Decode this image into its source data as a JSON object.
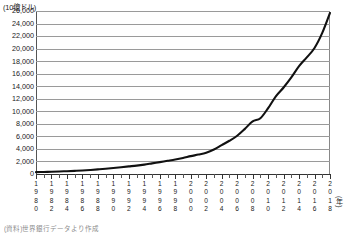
{
  "chart_data": {
    "type": "line",
    "title": "",
    "xlabel": "(年)",
    "ylabel": "(10億ドル)",
    "y_unit_label": "(10億ドル)",
    "x_unit_label": "(年)",
    "ylim": [
      0,
      26000
    ],
    "ytick_step": 2000,
    "grid": true,
    "legend": null,
    "yticks": [
      "26,000",
      "24,000",
      "22,000",
      "20,000",
      "18,000",
      "16,000",
      "14,000",
      "12,000",
      "10,000",
      "8,000",
      "6,000",
      "4,000",
      "2,000",
      "0"
    ],
    "ytick_values": [
      26000,
      24000,
      22000,
      20000,
      18000,
      16000,
      14000,
      12000,
      10000,
      8000,
      6000,
      4000,
      2000,
      0
    ],
    "xtick_labels": [
      "1980",
      "1982",
      "1984",
      "1986",
      "1988",
      "1990",
      "1992",
      "1994",
      "1996",
      "1998",
      "2000",
      "2002",
      "2004",
      "2006",
      "2008",
      "2010",
      "2012",
      "2014",
      "2016",
      "2018"
    ],
    "x": [
      1980,
      1981,
      1982,
      1983,
      1984,
      1985,
      1986,
      1987,
      1988,
      1989,
      1990,
      1991,
      1992,
      1993,
      1994,
      1995,
      1996,
      1997,
      1998,
      1999,
      2000,
      2001,
      2002,
      2003,
      2004,
      2005,
      2006,
      2007,
      2008,
      2009,
      2010,
      2011,
      2012,
      2013,
      2014,
      2015,
      2016,
      2017,
      2018
    ],
    "values": [
      300,
      330,
      360,
      400,
      450,
      500,
      560,
      640,
      730,
      830,
      950,
      1080,
      1210,
      1340,
      1500,
      1700,
      1900,
      2100,
      2300,
      2550,
      2850,
      3100,
      3400,
      3900,
      4600,
      5300,
      6100,
      7200,
      8400,
      8900,
      10500,
      12400,
      13800,
      15400,
      17200,
      18600,
      20100,
      22500,
      25700
    ],
    "series_color": "#111111",
    "gridline_color": "#9a9a9a",
    "axis_color": "#333333",
    "background_color": "#ffffff",
    "line_width": 2.1
  },
  "footnote": {
    "text": "(資料)世界銀行データより作成"
  }
}
